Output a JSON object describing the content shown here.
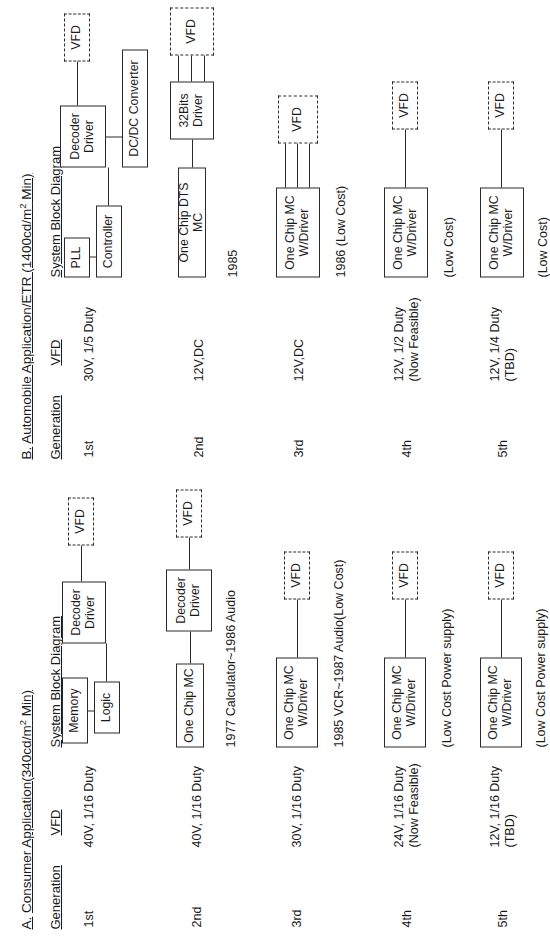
{
  "document": {
    "kind": "vfd-generation-roadmap",
    "sections": [
      {
        "id": "A",
        "title_prefix": "A.",
        "title": "Consumer Application(340cd/m2 Min)",
        "columns": {
          "generation": "Generation",
          "vfd": "VFD",
          "system_block_diagram": "System Block Diagram"
        },
        "rows": [
          {
            "generation": "1st",
            "vfd": "40V, 1/16 Duty",
            "blocks": [
              "Memory",
              "Logic",
              "Decoder Driver",
              "VFD"
            ],
            "note": ""
          },
          {
            "generation": "2nd",
            "vfd": "40V, 1/16 Duty",
            "blocks": [
              "One Chip MC",
              "Decoder Driver",
              "VFD"
            ],
            "note": "1977 Calculator~1986 Audio"
          },
          {
            "generation": "3rd",
            "vfd": "30V, 1/16 Duty",
            "blocks": [
              "One Chip MC W/Driver",
              "VFD"
            ],
            "note": "1985 VCR~1987 Audio(Low Cost)"
          },
          {
            "generation": "4th",
            "vfd": "24V, 1/16 Duty\n(Now Feasible)",
            "blocks": [
              "One Chip MC W/Driver",
              "VFD"
            ],
            "note": "(Low Cost Power supply)"
          },
          {
            "generation": "5th",
            "vfd": "12V, 1/16 Duty\n(TBD)",
            "blocks": [
              "One Chip MC W/Driver",
              "VFD"
            ],
            "note": "(Low Cost Power supply)"
          }
        ]
      },
      {
        "id": "B",
        "title_prefix": "B.",
        "title": "Automobile Application/ETR (1400cd/m2 Min)",
        "columns": {
          "generation": "Generation",
          "vfd": "VFD",
          "system_block_diagram": "System Block Diagram"
        },
        "rows": [
          {
            "generation": "1st",
            "vfd": "30V, 1/5 Duty",
            "blocks": [
              "PLL",
              "Controller",
              "Decoder Driver",
              "DC/DC Converter",
              "VFD"
            ],
            "note": ""
          },
          {
            "generation": "2nd",
            "vfd": "12V,DC",
            "blocks": [
              "One Chip DTS  MC",
              "32Bits Driver",
              "VFD"
            ],
            "note": "1985"
          },
          {
            "generation": "3rd",
            "vfd": "12V,DC",
            "blocks": [
              "One Chip MC W/Driver",
              "VFD"
            ],
            "note": "1986 (Low Cost)"
          },
          {
            "generation": "4th",
            "vfd": "12V, 1/2 Duty\n(Now Feasible)",
            "blocks": [
              "One Chip MC W/Driver",
              "VFD"
            ],
            "note": "(Low Cost)"
          },
          {
            "generation": "5th",
            "vfd": "12V, 1/4 Duty\n(TBD)",
            "blocks": [
              "One Chip MC W/Driver",
              "VFD"
            ],
            "note": "(Low Cost)"
          }
        ]
      }
    ],
    "labels": {
      "memory": "Memory",
      "logic": "Logic",
      "decoder_driver": "Decoder\nDriver",
      "vfd_block": "VFD",
      "one_chip_mc": "One Chip MC",
      "one_chip_mc_w_driver": "One Chip MC\nW/Driver",
      "pll": "PLL",
      "controller": "Controller",
      "dcdc_converter": "DC/DC Converter",
      "one_chip_dts_mc": "One Chip DTS  MC",
      "bits32_driver": "32Bits\nDriver"
    },
    "colors": {
      "ink": "#1a1a1a",
      "stroke": "#2b2b2b",
      "paper": "#ffffff"
    }
  }
}
